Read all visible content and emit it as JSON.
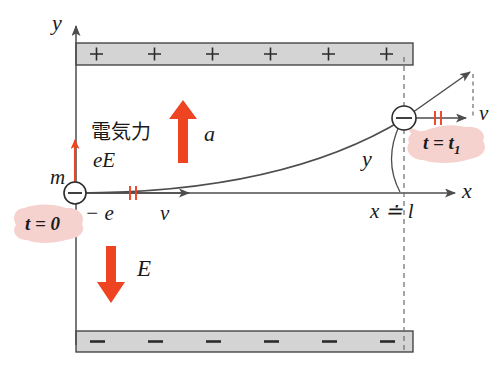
{
  "figure": {
    "background_color": "#ffffff",
    "line_color": "#4d4d4d",
    "text_color": "#1a1a1a",
    "accent_color": "#ee4422",
    "badge_color": "#f6d2cf",
    "plate_fill": "#d4d4d4",
    "plate_stroke": "#3a3a3a"
  },
  "axes": {
    "y_label": "y",
    "x_label": "x",
    "origin_x": 75,
    "origin_y": 193
  },
  "plates": {
    "top": {
      "charge_symbol": "+",
      "count": 6,
      "label": "positive-plate"
    },
    "bottom": {
      "charge_symbol": "–",
      "count": 6,
      "label": "negative-plate"
    }
  },
  "particle": {
    "charge_glyph": "–",
    "charge_label": "− e",
    "mass_label": "m",
    "start_time_label": "t = 0",
    "end_time_label_main": "t = t",
    "end_time_label_sub": "1"
  },
  "vectors": {
    "electric_force": {
      "label": "eE",
      "caption_jp": "電気力",
      "direction": "up",
      "color": "#ee4422"
    },
    "acceleration": {
      "label": "a",
      "direction": "up",
      "color": "#ee4422"
    },
    "field": {
      "label": "E",
      "direction": "down",
      "color": "#ee4422"
    },
    "velocity_initial": {
      "label": "v",
      "direction": "right",
      "color": "#4d4d4d"
    },
    "velocity_final": {
      "label": "v",
      "direction": "right",
      "color": "#4d4d4d"
    }
  },
  "annotations": {
    "displacement_y": "y",
    "distance_x": "x ≐ l"
  }
}
